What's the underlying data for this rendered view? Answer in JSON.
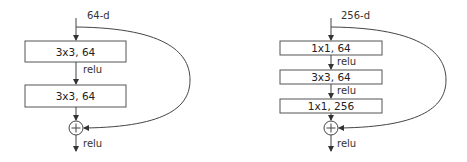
{
  "left_block": {
    "input_label": "64-d",
    "layers": [
      "3x3, 64",
      "3x3, 64"
    ],
    "activations": [
      "relu",
      "relu"
    ],
    "add_symbol": "+"
  },
  "right_block": {
    "input_label": "256-d",
    "layers": [
      "1x1, 64",
      "3x3, 64",
      "1x1, 256"
    ],
    "activations": [
      "relu",
      "relu",
      "relu"
    ],
    "add_symbol": "+"
  },
  "colors": {
    "stroke": "#444444",
    "text": "#333333",
    "background": "#ffffff"
  }
}
